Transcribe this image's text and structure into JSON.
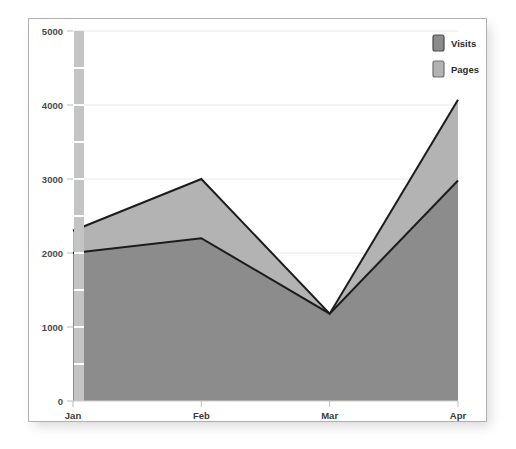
{
  "chart_data": {
    "type": "area",
    "title": "",
    "subtitle": "",
    "xlabel": "",
    "ylabel": "",
    "categories": [
      "Jan",
      "Feb",
      "Mar",
      "Apr"
    ],
    "series": [
      {
        "name": "Visits",
        "values": [
          2000,
          2200,
          1180,
          2980
        ],
        "color": "#8c8c8c"
      },
      {
        "name": "Pages",
        "values": [
          2300,
          3000,
          1180,
          4070
        ],
        "color": "#b3b3b3"
      }
    ],
    "ylim": [
      0,
      5000
    ],
    "yticks": [
      0,
      1000,
      2000,
      3000,
      4000,
      5000
    ],
    "ytick_labels": [
      "0",
      "1000",
      "2000",
      "3000",
      "4000",
      "5000"
    ],
    "xtick_labels": [
      "Jan",
      "Feb",
      "Mar",
      "Apr"
    ],
    "grid": true,
    "grid_color": "#e8e8e8",
    "legend": {
      "position": "top-right",
      "entries": [
        {
          "label": "Visits",
          "swatch_color": "#8c8c8c",
          "swatch_border": "#4a4a4a"
        },
        {
          "label": "Pages",
          "swatch_color": "#b3b3b3",
          "swatch_border": "#6e6e6e"
        }
      ]
    },
    "line_color": "#1c1c1c",
    "line_width": 2,
    "plot_background": "#ffffff",
    "panel_background": "#ffffff",
    "panel_border_color": "#b0b0b0",
    "axis_color": "#cfcfcf",
    "scrollbar": {
      "name": "vertical-range-slider",
      "color": "#c4c4c4",
      "tick_color": "#ffffff"
    }
  },
  "axes": {
    "y_labels": [
      "5000",
      "4000",
      "3000",
      "2000",
      "1000",
      "0"
    ],
    "x_labels": [
      "Jan",
      "Feb",
      "Mar",
      "Apr"
    ]
  },
  "legend": {
    "visits_label": "Visits",
    "pages_label": "Pages"
  }
}
